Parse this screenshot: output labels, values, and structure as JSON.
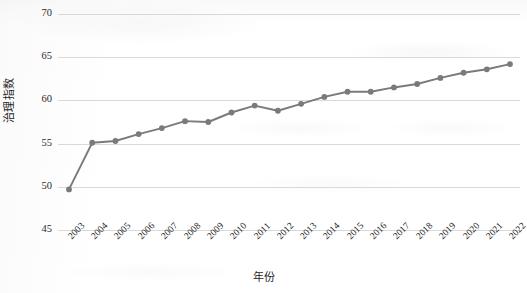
{
  "chart_data": {
    "type": "line",
    "title": "",
    "subtitle": "",
    "xlabel": "年份",
    "ylabel": "治理指数",
    "grid": true,
    "legend": false,
    "legend_position": "none",
    "series_color": "#7a7a7a",
    "marker": "circle",
    "xlim": [
      2003,
      2022
    ],
    "ylim": [
      45,
      70
    ],
    "yticks": [
      45,
      50,
      55,
      60,
      65,
      70
    ],
    "ytick_labels": [
      "45",
      "50",
      "55",
      "60",
      "65",
      "70"
    ],
    "categories": [
      "2003",
      "2004",
      "2005",
      "2006",
      "2007",
      "2008",
      "2009",
      "2010",
      "2011",
      "2012",
      "2013",
      "2014",
      "2015",
      "2016",
      "2017",
      "2018",
      "2019",
      "2020",
      "2021",
      "2022"
    ],
    "x": [
      2003,
      2004,
      2005,
      2006,
      2007,
      2008,
      2009,
      2010,
      2011,
      2012,
      2013,
      2014,
      2015,
      2016,
      2017,
      2018,
      2019,
      2020,
      2021,
      2022
    ],
    "values": [
      49.7,
      55.1,
      55.3,
      56.1,
      56.8,
      57.6,
      57.5,
      58.6,
      59.4,
      58.8,
      59.6,
      60.4,
      61.0,
      61.0,
      61.5,
      61.9,
      62.6,
      63.2,
      63.6,
      64.2
    ],
    "series": [
      {
        "name": "治理指数",
        "values": [
          49.7,
          55.1,
          55.3,
          56.1,
          56.8,
          57.6,
          57.5,
          58.6,
          59.4,
          58.8,
          59.6,
          60.4,
          61.0,
          61.0,
          61.5,
          61.9,
          62.6,
          63.2,
          63.6,
          64.2
        ]
      }
    ],
    "annotations": []
  },
  "axes": {
    "y_title": "治理指数",
    "x_title": "年份"
  }
}
